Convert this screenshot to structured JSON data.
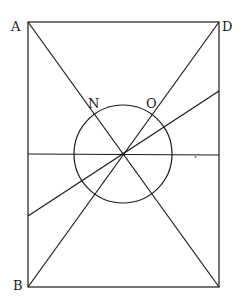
{
  "diagram": {
    "type": "geometric-figure",
    "labels": {
      "A": "A",
      "B": "B",
      "D": "D",
      "N": "N",
      "O": "O"
    },
    "stray_mark": "’",
    "colors": {
      "ink": "#1a1a1a",
      "paper": "#ffffff"
    }
  }
}
